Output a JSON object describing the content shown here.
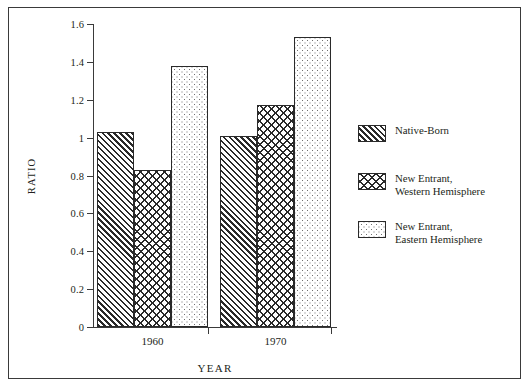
{
  "chart_data": {
    "type": "bar",
    "title": "",
    "xlabel": "YEAR",
    "ylabel": "RATIO",
    "categories": [
      "1960",
      "1970"
    ],
    "ylim": [
      0,
      1.6
    ],
    "yticks": [
      "0",
      "0.2",
      "0.4",
      "0.6",
      "0.8",
      "1",
      "1.2",
      "1.4",
      "1.6"
    ],
    "ytick_values": [
      0,
      0.2,
      0.4,
      0.6,
      0.8,
      1.0,
      1.2,
      1.4,
      1.6
    ],
    "grid": false,
    "legend_position": "right",
    "series": [
      {
        "name": "Native-Born",
        "pattern": "diagonal-hatch",
        "values": [
          1.03,
          1.01
        ]
      },
      {
        "name": "New Entrant,\nWestern Hemisphere",
        "pattern": "cross-hatch",
        "values": [
          0.83,
          1.17
        ]
      },
      {
        "name": "New Entrant,\nEastern Hemisphere",
        "pattern": "dots",
        "values": [
          1.38,
          1.53
        ]
      }
    ]
  },
  "legend": {
    "entries": [
      "Native-Born",
      "New Entrant,\nWestern Hemisphere",
      "New Entrant,\nEastern Hemisphere"
    ]
  },
  "colors": {
    "ink": "#231f20",
    "axis": "#3a3a3a",
    "bar_outline": "#2a2a2a",
    "background": "#ffffff"
  }
}
